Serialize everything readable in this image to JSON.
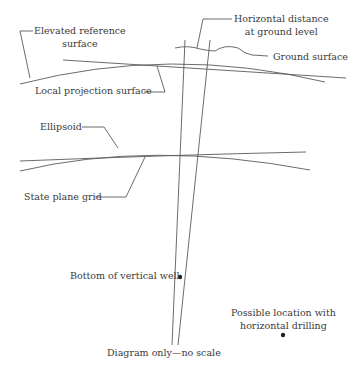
{
  "diagram": {
    "labels": {
      "elevated_reference_line1": "Elevated reference",
      "elevated_reference_line2": "surface",
      "horizontal_distance_line1": "Horizontal distance",
      "horizontal_distance_line2": "at ground level",
      "ground_surface": "Ground surface",
      "local_projection_surface": "Local projection surface",
      "ellipsoid": "Ellipsoid",
      "state_plane_grid": "State plane grid",
      "bottom_of_vertical_well": "Bottom of vertical well",
      "possible_location_line1": "Possible location with",
      "possible_location_line2": "horizontal drilling",
      "footnote": "Diagram only—no scale"
    },
    "colors": {
      "line": "#555555",
      "text": "#3a3a3a",
      "dot": "#222222",
      "background": "#ffffff"
    }
  }
}
